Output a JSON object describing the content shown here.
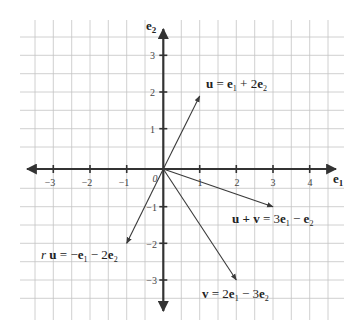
{
  "diagram": {
    "origin_label": "0",
    "axes": {
      "x_label_base": "e",
      "x_label_sub": "1",
      "y_label_base": "e",
      "y_label_sub": "2"
    },
    "x_ticks": [
      "−3",
      "−2",
      "−1",
      "1",
      "2",
      "3",
      "4"
    ],
    "y_ticks": [
      "3",
      "2",
      "1",
      "−1",
      "−2",
      "−3"
    ],
    "vectors": [
      {
        "name": "u",
        "x": 1,
        "y": 2,
        "label": "u = e₁ + 2e₂"
      },
      {
        "name": "v",
        "x": 2,
        "y": -3,
        "label": "v = 2e₁ − 3e₂"
      },
      {
        "name": "u+v",
        "x": 3,
        "y": -1,
        "label": "u + v = 3e₁ − e₂"
      },
      {
        "name": "r u",
        "x": -1,
        "y": -2,
        "label": "r u = −e₁ − 2e₂"
      }
    ],
    "labels": {
      "u": {
        "lhs": "u",
        "eq": " = ",
        "t1": "e",
        "s1": "1",
        "op": " + 2",
        "t2": "e",
        "s2": "2"
      },
      "uv": {
        "lhs": "u + v",
        "eq": " = 3",
        "t1": "e",
        "s1": "1",
        "op": " − ",
        "t2": "e",
        "s2": "2"
      },
      "v": {
        "lhs": "v",
        "eq": " = 2",
        "t1": "e",
        "s1": "1",
        "op": " − 3",
        "t2": "e",
        "s2": "2"
      },
      "ru": {
        "r": "r ",
        "lhs": "u",
        "eq": " = −",
        "t1": "e",
        "s1": "1",
        "op": " − 2",
        "t2": "e",
        "s2": "2"
      }
    }
  }
}
